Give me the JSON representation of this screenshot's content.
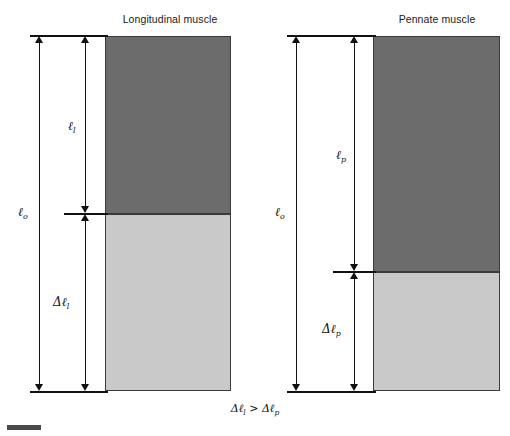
{
  "figure": {
    "width": 510,
    "height": 436,
    "background": "#ffffff",
    "colors": {
      "muscle_dark": "#6c6c6c",
      "muscle_light": "#c9c9c9",
      "outline": "#3a3a3a",
      "rule": "#111111",
      "text": "#1a1a1a"
    },
    "caption": "Δℓl > Δℓp"
  },
  "panels": [
    {
      "id": "longitudinal",
      "title": "Longitudinal muscle",
      "bar": {
        "dark_label": "contracted-region",
        "light_label": "shortening-region"
      },
      "measures": [
        {
          "name": "total-length",
          "symbol": "ℓ",
          "subscript": "o"
        },
        {
          "name": "fiber-length",
          "symbol": "ℓ",
          "subscript": "l"
        },
        {
          "name": "length-change",
          "symbol": "Δℓ",
          "subscript": "l"
        }
      ]
    },
    {
      "id": "pennate",
      "title": "Pennate muscle",
      "bar": {
        "dark_label": "contracted-region",
        "light_label": "shortening-region"
      },
      "measures": [
        {
          "name": "total-length",
          "symbol": "ℓ",
          "subscript": "o"
        },
        {
          "name": "fiber-length",
          "symbol": "ℓ",
          "subscript": "p"
        },
        {
          "name": "length-change",
          "symbol": "Δℓ",
          "subscript": "p"
        }
      ]
    }
  ],
  "labels": {
    "left_lo_sym": "ℓ",
    "left_lo_sub": "o",
    "left_ll_sym": "ℓ",
    "left_ll_sub": "l",
    "left_dl_sym": "Δℓ",
    "left_dl_sub": "l",
    "right_lo_sym": "ℓ",
    "right_lo_sub": "o",
    "right_lp_sym": "ℓ",
    "right_lp_sub": "p",
    "right_dp_sym": "Δℓ",
    "right_dp_sub": "p",
    "caption_left_sym": "Δℓ",
    "caption_left_sub": "l",
    "caption_op": ">",
    "caption_right_sym": "Δℓ",
    "caption_right_sub": "p"
  }
}
